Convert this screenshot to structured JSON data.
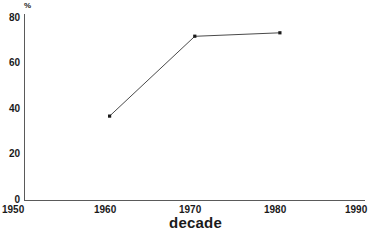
{
  "chart_data": {
    "type": "line",
    "title": "",
    "subtitle": "",
    "xlabel": "decade",
    "ylabel": "%",
    "ylabel_position": "above-axis-top",
    "x": [
      1960,
      1970,
      1980
    ],
    "values": [
      37,
      72,
      73.5
    ],
    "series": [
      {
        "name": "percent by decade",
        "x": [
          1960,
          1970,
          1980
        ],
        "values": [
          37,
          72,
          73.5
        ]
      }
    ],
    "xlim": [
      1950,
      1990
    ],
    "ylim": [
      0,
      80
    ],
    "xticks": [
      1950,
      1960,
      1970,
      1980,
      1990
    ],
    "xtick_labels": [
      "1950",
      "1960",
      "1970",
      "1980",
      "1990"
    ],
    "yticks": [
      0,
      20,
      40,
      60,
      80
    ],
    "ytick_labels": [
      "0",
      "20",
      "40",
      "60",
      "80"
    ],
    "grid": false,
    "legend": false,
    "legend_position": "none",
    "marker": "square",
    "line_color": "#4a4a4a",
    "marker_color": "#1a1a1a",
    "axis_color": "#5a5a5a",
    "background_color": "#ffffff",
    "annotations": []
  },
  "axes": {
    "y_unit_label": "%",
    "x_axis_title": "decade"
  },
  "ticks": {
    "y": [
      {
        "label": "80",
        "value": 80
      },
      {
        "label": "60",
        "value": 60
      },
      {
        "label": "40",
        "value": 40
      },
      {
        "label": "20",
        "value": 20
      },
      {
        "label": "0",
        "value": 0
      }
    ],
    "x": [
      {
        "label": "1950",
        "value": 1950
      },
      {
        "label": "1960",
        "value": 1960
      },
      {
        "label": "1970",
        "value": 1970
      },
      {
        "label": "1980",
        "value": 1980
      },
      {
        "label": "1990",
        "value": 1990
      }
    ]
  }
}
